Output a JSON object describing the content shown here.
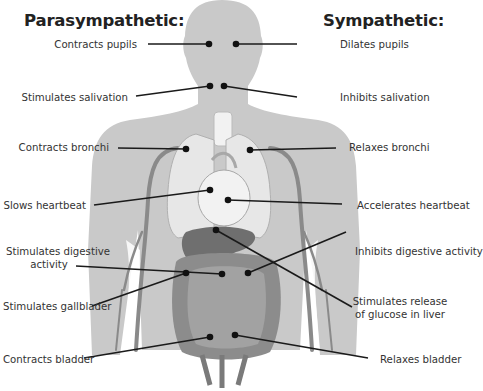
{
  "headings": {
    "parasympathetic": "Parasympathetic:",
    "sympathetic": "Sympathetic:"
  },
  "colors": {
    "background": "#ffffff",
    "body_silhouette": "#c9c9c9",
    "body_shadow": "#bdbdbd",
    "vessel": "#8a8a8a",
    "lungs": "#e6e6e6",
    "heart": "#f0f0f0",
    "liver": "#6f6f6f",
    "intestine": "#9a9a9a",
    "colon": "#8c8c8c",
    "leader_line": "#1a1a1a",
    "text": "#333333"
  },
  "parasympathetic": [
    {
      "label": "Contracts pupils",
      "target": "eyes"
    },
    {
      "label": "Stimulates salivation",
      "target": "salivary glands"
    },
    {
      "label": "Contracts bronchi",
      "target": "lungs"
    },
    {
      "label": "Slows heartbeat",
      "target": "heart"
    },
    {
      "label": "Stimulates digestive activity",
      "label_lines": [
        "Stimulates digestive",
        "activity"
      ],
      "target": "stomach/intestines"
    },
    {
      "label": "Stimulates gallblader",
      "target": "gallbladder"
    },
    {
      "label": "Contracts bladder",
      "target": "bladder"
    }
  ],
  "sympathetic": [
    {
      "label": "Dilates pupils",
      "target": "eyes"
    },
    {
      "label": "Inhibits salivation",
      "target": "salivary glands"
    },
    {
      "label": "Relaxes bronchi",
      "target": "lungs"
    },
    {
      "label": "Accelerates heartbeat",
      "target": "heart"
    },
    {
      "label": "Inhibits digestive activity",
      "target": "stomach/intestines"
    },
    {
      "label": "Stimulates release of glucose in liver",
      "label_lines": [
        "Stimulates release",
        "of glucose in liver"
      ],
      "target": "liver"
    },
    {
      "label": "Relaxes bladder",
      "target": "bladder"
    }
  ]
}
